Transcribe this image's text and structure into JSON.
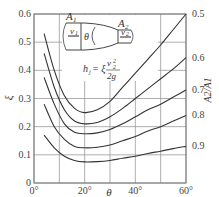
{
  "chart_data": {
    "type": "line",
    "title": "",
    "xlabel": "θ",
    "ylabel": "ξ",
    "y2label": "A2/A1",
    "xlim": [
      0,
      60
    ],
    "ylim": [
      0,
      0.6
    ],
    "grid": true,
    "x_ticks": [
      0,
      20,
      40,
      60
    ],
    "x_tick_labels": [
      "0°",
      "20°",
      "40°",
      "60°"
    ],
    "y_ticks": [
      0,
      0.1,
      0.2,
      0.3,
      0.4,
      0.5,
      0.6
    ],
    "y_tick_labels": [
      "0",
      "0.1",
      "0.2",
      "0.3",
      "0.4",
      "0.5",
      "0.6"
    ],
    "legend_position": "right-edge curve labels",
    "inset": {
      "labels": [
        "A1",
        "A2",
        "v1",
        "v2",
        "θ"
      ],
      "formula": "h_j = ξ v2²/2g"
    },
    "x": [
      4,
      8,
      12,
      16,
      20,
      25,
      30,
      35,
      40,
      45,
      50,
      55,
      60
    ],
    "series": [
      {
        "name": "0.5",
        "values": [
          0.53,
          0.4,
          0.31,
          0.265,
          0.25,
          0.26,
          0.29,
          0.34,
          0.39,
          0.44,
          0.49,
          0.545,
          0.6
        ]
      },
      {
        "name": "0.6",
        "values": [
          0.46,
          0.34,
          0.26,
          0.22,
          0.21,
          0.215,
          0.235,
          0.265,
          0.3,
          0.335,
          0.37,
          0.405,
          0.445
        ]
      },
      {
        "name": "0.7",
        "values": [
          0.375,
          0.28,
          0.21,
          0.18,
          0.175,
          0.178,
          0.19,
          0.21,
          0.235,
          0.26,
          0.28,
          0.305,
          0.33
        ]
      },
      {
        "name": "0.8",
        "values": [
          0.28,
          0.2,
          0.155,
          0.13,
          0.125,
          0.127,
          0.135,
          0.15,
          0.165,
          0.185,
          0.2,
          0.22,
          0.24
        ]
      },
      {
        "name": "0.9",
        "values": [
          0.17,
          0.125,
          0.095,
          0.08,
          0.075,
          0.076,
          0.08,
          0.088,
          0.095,
          0.105,
          0.113,
          0.122,
          0.13
        ]
      }
    ]
  }
}
